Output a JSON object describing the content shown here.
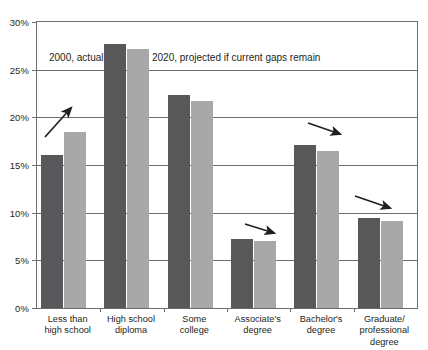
{
  "chart_data": {
    "type": "bar",
    "title": "",
    "subtitle": "",
    "xlabel": "",
    "ylabel": "",
    "ylim": [
      0,
      30
    ],
    "ytick_values": [
      0,
      5,
      10,
      15,
      20,
      25,
      30
    ],
    "ytick_labels": [
      "0%",
      "5%",
      "10%",
      "15%",
      "20%",
      "25%",
      "30%"
    ],
    "grid": true,
    "legend_position": "inside-top-left",
    "categories": [
      "Less than\nhigh school",
      "High school\ndiploma",
      "Some\ncollege",
      "Associate's\ndegree",
      "Bachelor's\ndegree",
      "Graduate/\nprofessional\ndegree"
    ],
    "category_lines": [
      [
        "Less than",
        "high school"
      ],
      [
        "High school",
        "diploma"
      ],
      [
        "Some",
        "college"
      ],
      [
        "Associate's",
        "degree"
      ],
      [
        "Bachelor's",
        "degree"
      ],
      [
        "Graduate/",
        "professional",
        "degree"
      ]
    ],
    "series": [
      {
        "name": "2000, actual",
        "color": "#58585a",
        "values": [
          16.1,
          27.7,
          22.3,
          7.2,
          17.1,
          9.4
        ]
      },
      {
        "name": "2020, projected if current gaps remain",
        "color": "#a8a8a8",
        "values": [
          18.5,
          27.2,
          21.7,
          7.0,
          16.5,
          9.1
        ]
      }
    ],
    "annotations": [
      {
        "name": "trend-arrow-up-less-than-high-school",
        "direction": "up-right",
        "category": "Less than high school"
      },
      {
        "name": "trend-arrow-down-associates-degree",
        "direction": "down-right",
        "category": "Associate's degree"
      },
      {
        "name": "trend-arrow-down-bachelors-degree",
        "direction": "down-right",
        "category": "Bachelor's degree"
      },
      {
        "name": "trend-arrow-down-graduate-degree",
        "direction": "down-right",
        "category": "Graduate/professional degree"
      }
    ]
  },
  "legend": {
    "actual_label": "2000, actual",
    "projected_label": "2020, projected if current gaps remain"
  },
  "colors": {
    "actual": "#58585a",
    "projected": "#a8a8a8",
    "axis": "#6d6e71",
    "text": "#231f20",
    "background": "#ffffff"
  }
}
